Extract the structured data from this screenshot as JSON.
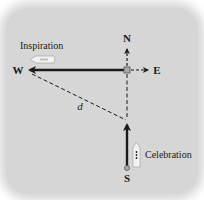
{
  "diagram": {
    "compass": {
      "north": "N",
      "east": "E",
      "west": "W",
      "south": "S"
    },
    "ships": [
      {
        "name": "Inspiration",
        "heading": "west"
      },
      {
        "name": "Celebration",
        "heading": "north"
      }
    ],
    "distance_label": "d",
    "colors": {
      "panel": "#d6d6d6",
      "line": "#1a1a1a",
      "origin_marker": "#a8a8a8",
      "ship_hull": "#f2f2f2"
    }
  }
}
